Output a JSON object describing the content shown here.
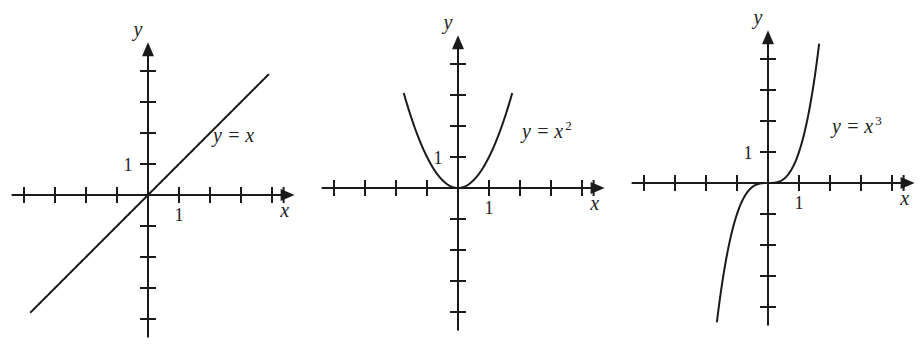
{
  "chart_data": [
    {
      "type": "line",
      "title": "y = x",
      "label": "y = x",
      "function": "x",
      "xlabel": "x",
      "ylabel": "y",
      "x_tick_label": "1",
      "y_tick_label": "1",
      "xlim": [
        -4.4,
        4.6
      ],
      "ylim": [
        -4.6,
        4.8
      ],
      "x_ticks": [
        -4,
        -3,
        -2,
        -1,
        1,
        2,
        3,
        4
      ],
      "y_ticks": [
        -4,
        -3,
        -2,
        -1,
        1,
        2,
        3,
        4
      ],
      "domain": [
        -3.8,
        3.9
      ],
      "grid": false,
      "origin_px": [
        148,
        195
      ],
      "unit_px": 31,
      "label_pos_px": [
        213,
        142
      ],
      "superscript": ""
    },
    {
      "type": "line",
      "title": "y = x^2",
      "label": "y = x",
      "function": "x^2",
      "xlabel": "x",
      "ylabel": "y",
      "x_tick_label": "1",
      "y_tick_label": "1",
      "xlim": [
        -4.4,
        4.6
      ],
      "ylim": [
        -4.6,
        4.8
      ],
      "x_ticks": [
        -4,
        -3,
        -2,
        -1,
        1,
        2,
        3,
        4
      ],
      "y_ticks": [
        -4,
        -3,
        -2,
        -1,
        1,
        2,
        3,
        4
      ],
      "domain": [
        -1.75,
        1.75
      ],
      "grid": false,
      "origin_px": [
        458,
        188
      ],
      "unit_px": 31,
      "label_pos_px": [
        522,
        138
      ],
      "superscript": "2"
    },
    {
      "type": "line",
      "title": "y = x^3",
      "label": "y = x",
      "function": "x^3",
      "xlabel": "x",
      "ylabel": "y",
      "x_tick_label": "1",
      "y_tick_label": "1",
      "xlim": [
        -4.4,
        4.6
      ],
      "ylim": [
        -4.6,
        4.8
      ],
      "x_ticks": [
        -4,
        -3,
        -2,
        -1,
        1,
        2,
        3,
        4
      ],
      "y_ticks": [
        -4,
        -3,
        -2,
        -1,
        1,
        2,
        3,
        4
      ],
      "domain": [
        -1.65,
        1.65
      ],
      "grid": false,
      "origin_px": [
        768,
        183
      ],
      "unit_px": 31,
      "label_pos_px": [
        832,
        133
      ],
      "superscript": "3"
    }
  ]
}
